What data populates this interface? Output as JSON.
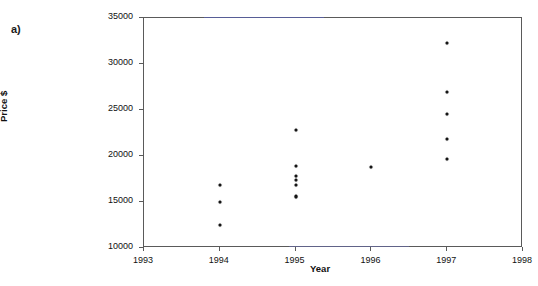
{
  "figure": {
    "panel_label": "a)",
    "background_color": "#ffffff",
    "frame_color": "#5a5a5a",
    "marker_color": "#151515"
  },
  "chart_data": {
    "type": "scatter",
    "title": "",
    "xlabel": "Year",
    "ylabel": "Price $",
    "xlim": [
      1993,
      1998
    ],
    "ylim": [
      10000,
      35000
    ],
    "xticks": [
      1993,
      1994,
      1995,
      1996,
      1997,
      1998
    ],
    "xtick_labels": [
      "1993",
      "1994",
      "1995",
      "1996",
      "1997",
      "1998"
    ],
    "yticks": [
      10000,
      15000,
      20000,
      25000,
      30000,
      35000
    ],
    "ytick_labels": [
      "10000",
      "15000",
      "20000",
      "25000",
      "30000",
      "35000"
    ],
    "grid": false,
    "legend": false,
    "series": [
      {
        "name": "Price by year",
        "marker": "dot",
        "color": "#151515",
        "points": [
          {
            "x": 1994,
            "y": 16900
          },
          {
            "x": 1994,
            "y": 14950
          },
          {
            "x": 1994,
            "y": 12450
          },
          {
            "x": 1995,
            "y": 22800
          },
          {
            "x": 1995,
            "y": 18900
          },
          {
            "x": 1995,
            "y": 17800
          },
          {
            "x": 1995,
            "y": 17350
          },
          {
            "x": 1995,
            "y": 16800
          },
          {
            "x": 1995,
            "y": 15700
          },
          {
            "x": 1995,
            "y": 15500
          },
          {
            "x": 1996,
            "y": 18800
          },
          {
            "x": 1997,
            "y": 32300
          },
          {
            "x": 1997,
            "y": 26950
          },
          {
            "x": 1997,
            "y": 24600
          },
          {
            "x": 1997,
            "y": 21800
          },
          {
            "x": 1997,
            "y": 19700
          }
        ]
      }
    ]
  }
}
